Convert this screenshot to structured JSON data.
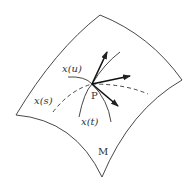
{
  "figure": {
    "surface_label": "M",
    "point_label": "P",
    "curves": [
      {
        "id": "u",
        "label": "x(u)"
      },
      {
        "id": "s",
        "label": "x(s)"
      },
      {
        "id": "t",
        "label": "x(t)"
      }
    ],
    "tangent_vectors": 3,
    "colors": {
      "stroke": "#222222",
      "background": "#ffffff"
    }
  }
}
